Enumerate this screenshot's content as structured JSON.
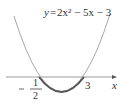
{
  "equation": {
    "y": "y",
    "eq": "=",
    "rhs": "2x² − 5x − 3",
    "full": "y = 2x² − 5x − 3"
  },
  "axis": {
    "x_label": "x"
  },
  "roots": {
    "left": {
      "sign": "−",
      "num": "1",
      "den": "2",
      "value": -0.5
    },
    "right": {
      "label": "3",
      "value": 3
    }
  },
  "colors": {
    "curve": "#999999",
    "highlight": "#555555",
    "axis": "#999999",
    "text": "#333333"
  }
}
